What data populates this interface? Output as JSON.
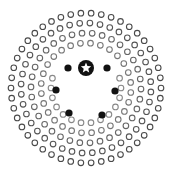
{
  "board": {
    "width": 171,
    "height": 175,
    "center": [
      86,
      88
    ],
    "background": "#ffffff",
    "hollow_stroke": "#5a5a5a",
    "hollow_radius": 2.8,
    "rings": [
      {
        "radius": 75,
        "count": 46,
        "offset": 0.0,
        "color": "#4a4a4a"
      },
      {
        "radius": 65,
        "count": 40,
        "offset": 0.06,
        "color": "#555555"
      },
      {
        "radius": 55,
        "count": 34,
        "offset": 0.02,
        "color": "#666666"
      },
      {
        "radius": 45,
        "count": 28,
        "offset": 0.1,
        "color": "#777777"
      },
      {
        "radius": 35,
        "count": 22,
        "offset": 0.0,
        "color": "#888888",
        "skip_arc": [
          -2.6,
          -0.55
        ]
      }
    ]
  },
  "star_marker": {
    "name": "star-start",
    "cx": 86,
    "cy": 68,
    "r": 8,
    "fill": "#111111",
    "star_color": "#ffffff"
  },
  "filled_dots": [
    {
      "cx": 68,
      "cy": 68,
      "r": 3.6
    },
    {
      "cx": 107,
      "cy": 68,
      "r": 3.6
    },
    {
      "cx": 56,
      "cy": 90,
      "r": 3.6
    },
    {
      "cx": 115,
      "cy": 91,
      "r": 3.6
    },
    {
      "cx": 69,
      "cy": 113,
      "r": 3.6
    },
    {
      "cx": 102,
      "cy": 115,
      "r": 3.6
    }
  ],
  "filled_color": "#111111"
}
